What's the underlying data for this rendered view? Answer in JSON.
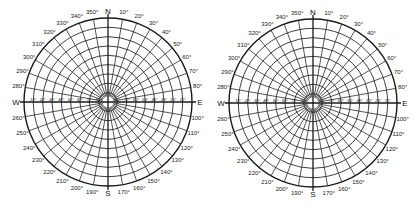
{
  "diagrams": [
    {
      "name": "sun-path-diagram-left",
      "center": [
        108,
        102
      ],
      "radius": 84
    },
    {
      "name": "sun-path-diagram-right",
      "center": [
        313,
        103
      ],
      "radius": 84
    }
  ],
  "cardinal_labels": {
    "N": "N",
    "E": "E",
    "S": "S",
    "W": "W"
  },
  "azimuth_labels": [
    {
      "deg": 10,
      "text": "10°"
    },
    {
      "deg": 20,
      "text": "20°"
    },
    {
      "deg": 30,
      "text": "30°"
    },
    {
      "deg": 40,
      "text": "40°"
    },
    {
      "deg": 50,
      "text": "50°"
    },
    {
      "deg": 60,
      "text": "60°"
    },
    {
      "deg": 70,
      "text": "70°"
    },
    {
      "deg": 80,
      "text": "80°"
    },
    {
      "deg": 100,
      "text": "100°"
    },
    {
      "deg": 110,
      "text": "110°"
    },
    {
      "deg": 120,
      "text": "120°"
    },
    {
      "deg": 130,
      "text": "130°"
    },
    {
      "deg": 140,
      "text": "140°"
    },
    {
      "deg": 150,
      "text": "150°"
    },
    {
      "deg": 160,
      "text": "160°"
    },
    {
      "deg": 170,
      "text": "170°"
    },
    {
      "deg": 190,
      "text": "190°"
    },
    {
      "deg": 200,
      "text": "200°"
    },
    {
      "deg": 210,
      "text": "210°"
    },
    {
      "deg": 220,
      "text": "220°"
    },
    {
      "deg": 230,
      "text": "230°"
    },
    {
      "deg": 240,
      "text": "240°"
    },
    {
      "deg": 250,
      "text": "250°"
    },
    {
      "deg": 260,
      "text": "260°"
    },
    {
      "deg": 280,
      "text": "280°"
    },
    {
      "deg": 290,
      "text": "290°"
    },
    {
      "deg": 300,
      "text": "300°"
    },
    {
      "deg": 310,
      "text": "310°"
    },
    {
      "deg": 320,
      "text": "320°"
    },
    {
      "deg": 330,
      "text": "330°"
    },
    {
      "deg": 340,
      "text": "340°"
    },
    {
      "deg": 350,
      "text": "350°"
    }
  ],
  "altitude_labels": [
    "10°",
    "20°",
    "30°",
    "40°",
    "50°",
    "60°",
    "70°",
    "80°"
  ],
  "grid": {
    "azimuth_step_deg": 10,
    "altitude_step_deg": 10,
    "ring_count": 9
  },
  "colors": {
    "line": "#2a2a2a",
    "text": "#222222",
    "background": "#ffffff"
  }
}
